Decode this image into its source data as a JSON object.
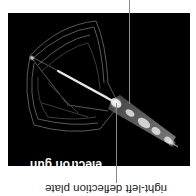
{
  "figure": {
    "labels": {
      "electron_gun": "electron gun",
      "deflection_plate": "right-left deflection plate"
    },
    "colors": {
      "background": "#ffffff",
      "photo_background": "#000000",
      "leader_line": "#8a8a8a",
      "inner_label": "#ffffff",
      "outer_label": "#222222"
    }
  }
}
